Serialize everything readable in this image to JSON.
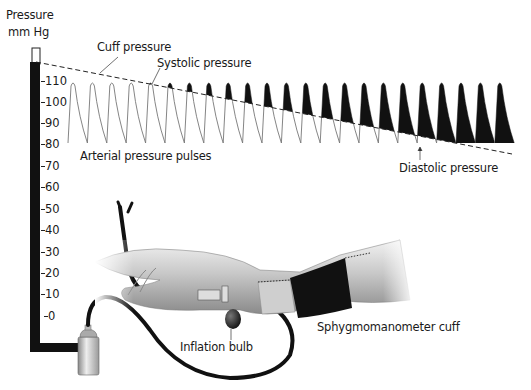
{
  "axis": {
    "title_line1": "Pressure",
    "title_line2": "mm Hg",
    "ticks": [
      "110",
      "100",
      "90",
      "80",
      "70",
      "60",
      "50",
      "40",
      "30",
      "20",
      "10",
      "0"
    ]
  },
  "labels": {
    "cuff_pressure": "Cuff pressure",
    "systolic_pressure": "Systolic pressure",
    "arterial_pulses": "Arterial pressure pulses",
    "diastolic_pressure": "Diastolic pressure",
    "cuff": "Sphygmomanometer cuff",
    "bulb": "Inflation bulb"
  },
  "colors": {
    "ink": "#111111",
    "pulse_line": "#777777",
    "skin_light": "#e6e6e6",
    "skin_dark": "#9a9a9a"
  },
  "pulses": {
    "count": 23,
    "first_peak_x": 73,
    "spacing": 19.4,
    "peak_y": 82,
    "base_y": 143,
    "cuff_start": [
      36,
      62
    ],
    "cuff_end": [
      512,
      154
    ]
  }
}
